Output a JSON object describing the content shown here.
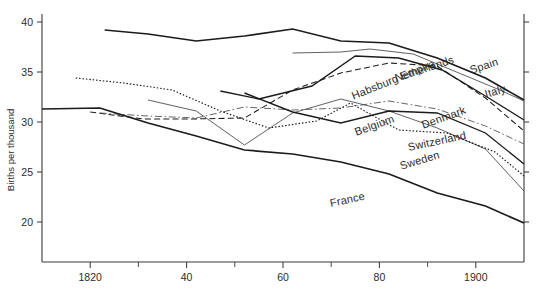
{
  "chart_data": {
    "type": "line",
    "title": "",
    "xlabel": "",
    "ylabel": "Births per thousand",
    "xlim": [
      1810,
      1910
    ],
    "ylim": [
      18,
      40
    ],
    "grid": false,
    "legend_position": "inline-right-labels",
    "yticks": [
      {
        "value": 40,
        "label": "40"
      },
      {
        "value": 35,
        "label": "35"
      },
      {
        "value": 30,
        "label": "30"
      },
      {
        "value": 25,
        "label": "25"
      },
      {
        "value": 20,
        "label": "20"
      }
    ],
    "xticks_major": [
      {
        "value": 1820,
        "label": "1820"
      },
      {
        "value": 1840,
        "label": "40"
      },
      {
        "value": 1860,
        "label": "60"
      },
      {
        "value": 1880,
        "label": "80"
      },
      {
        "value": 1900,
        "label": "1900"
      }
    ],
    "xticks_minor": [
      1830,
      1850,
      1870,
      1890
    ],
    "series": [
      {
        "name": "Spain",
        "style": "solid-thick",
        "label_x": 470,
        "label_y": 64,
        "label_rotate": -18,
        "x": [
          1823,
          1832,
          1842,
          1852,
          1862,
          1872,
          1882,
          1892,
          1902,
          1910
        ],
        "values": [
          39.2,
          38.8,
          38.1,
          38.6,
          39.3,
          38.1,
          37.9,
          36.4,
          34.4,
          32.2
        ]
      },
      {
        "name": "Italy",
        "style": "solid-thin",
        "label_x": 485,
        "label_y": 88,
        "label_rotate": -16,
        "x": [
          1862,
          1872,
          1878,
          1887,
          1896,
          1905,
          1910
        ],
        "values": [
          36.9,
          37.0,
          37.3,
          36.8,
          35.0,
          33.2,
          32.1
        ]
      },
      {
        "name": "Netherlands",
        "style": "solid-med",
        "label_x": 395,
        "label_y": 72,
        "label_rotate": -18,
        "x": [
          1847,
          1855,
          1866,
          1875,
          1884,
          1893,
          1902,
          1910
        ],
        "values": [
          33.1,
          32.3,
          33.6,
          36.6,
          36.4,
          35.2,
          32.6,
          30.2
        ]
      },
      {
        "name": "Habsburg Empire",
        "style": "dashed",
        "label_x": 352,
        "label_y": 90,
        "label_rotate": -22,
        "x": [
          1820,
          1831,
          1841,
          1852,
          1862,
          1872,
          1882,
          1892,
          1902,
          1910
        ],
        "values": [
          31.0,
          30.3,
          30.3,
          30.4,
          33.2,
          34.9,
          35.9,
          35.6,
          32.4,
          29.1
        ]
      },
      {
        "name": "Denmark",
        "style": "dashdot",
        "label_x": 422,
        "label_y": 119,
        "label_rotate": -20,
        "x": [
          1822,
          1832,
          1842,
          1852,
          1862,
          1872,
          1882,
          1892,
          1902,
          1910
        ],
        "values": [
          30.9,
          30.6,
          30.4,
          31.5,
          31.2,
          31.4,
          32.1,
          31.3,
          29.6,
          27.8
        ]
      },
      {
        "name": "Belgium",
        "style": "solid-thin",
        "label_x": 355,
        "label_y": 126,
        "label_rotate": -20,
        "x": [
          1832,
          1842,
          1852,
          1862,
          1872,
          1882,
          1892,
          1902,
          1910
        ],
        "values": [
          32.2,
          31.1,
          27.7,
          30.9,
          32.3,
          31.1,
          29.4,
          27.3,
          23.1
        ]
      },
      {
        "name": "Switzerland",
        "style": "solid-med",
        "label_x": 408,
        "label_y": 141,
        "label_rotate": -12,
        "x": [
          1852,
          1862,
          1872,
          1882,
          1892,
          1902,
          1910
        ],
        "values": [
          32.9,
          31.0,
          29.9,
          31.1,
          30.9,
          28.9,
          25.8
        ]
      },
      {
        "name": "Sweden",
        "style": "dotted",
        "label_x": 400,
        "label_y": 160,
        "label_rotate": -17,
        "x": [
          1817,
          1827,
          1837,
          1847,
          1857,
          1867,
          1874,
          1884,
          1894,
          1904,
          1910
        ],
        "values": [
          34.4,
          33.9,
          33.2,
          31.1,
          29.4,
          30.1,
          31.9,
          29.2,
          28.9,
          27.0,
          24.6
        ]
      },
      {
        "name": "France",
        "style": "solid-thick",
        "label_x": 330,
        "label_y": 197,
        "label_rotate": -12,
        "x": [
          1810,
          1822,
          1832,
          1842,
          1852,
          1862,
          1872,
          1882,
          1892,
          1902,
          1910
        ],
        "values": [
          31.3,
          31.4,
          29.9,
          28.6,
          27.2,
          26.8,
          26.0,
          24.8,
          22.9,
          21.6,
          19.9
        ]
      }
    ]
  }
}
